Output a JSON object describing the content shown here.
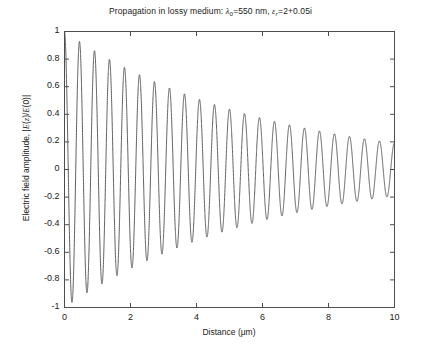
{
  "chart_data": {
    "type": "line",
    "title_parts": {
      "prefix": "Propagation in lossy medium: ",
      "lambda_symbol": "λ",
      "lambda_subscript": "0",
      "lambda_value": "=550 nm, ",
      "epsilon_symbol": "ε",
      "epsilon_subscript": "r",
      "epsilon_value": "=2+0.05i"
    },
    "xlabel": "Distance (μm)",
    "ylabel": "Electric field amplitude, |E(z)/E(0)|",
    "ylabel_parts": {
      "prefix": "Electric field amplitude, |",
      "e_symbol": "E",
      "open": "(",
      "z_symbol": "z",
      "mid": ")/",
      "e2_symbol": "E",
      "suffix": "(0)|"
    },
    "xlim": [
      0,
      10
    ],
    "ylim": [
      -1,
      1
    ],
    "xticks": [
      0,
      2,
      4,
      6,
      8,
      10
    ],
    "xtick_labels": [
      "0",
      "2",
      "4",
      "6",
      "8",
      "10"
    ],
    "yticks": [
      -1,
      -0.8,
      -0.6,
      -0.4,
      -0.2,
      0,
      0.2,
      0.4,
      0.6,
      0.8,
      1
    ],
    "ytick_labels": [
      "-1",
      "-0.8",
      "-0.6",
      "-0.4",
      "-0.2",
      "0",
      "0.2",
      "0.4",
      "0.6",
      "0.8",
      "1"
    ],
    "grid": false,
    "legend": null,
    "line_color": "#4d4d4d",
    "axes_color": "#4d4d4d",
    "background_color": "#ffffff",
    "series": [
      {
        "name": "Electric field amplitude",
        "model": "exp(-alpha*z)*cos(2*pi*z/period)",
        "alpha_per_um": 0.1655,
        "period_um": 0.4545,
        "amplitude_at_0": 1.0,
        "envelope_samples": {
          "z_um": [
            0,
            1,
            2,
            3,
            4,
            5,
            6,
            7,
            8,
            9,
            10
          ],
          "amplitude": [
            1.0,
            0.847,
            0.718,
            0.609,
            0.516,
            0.437,
            0.37,
            0.314,
            0.266,
            0.225,
            0.191
          ]
        }
      }
    ]
  }
}
